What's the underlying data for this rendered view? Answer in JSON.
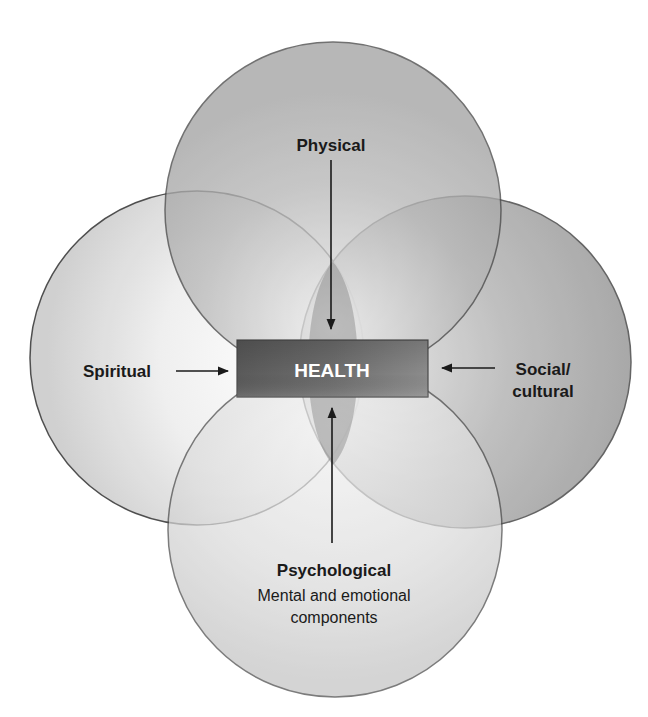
{
  "diagram": {
    "center": {
      "label": "HEALTH"
    },
    "dimensions": [
      {
        "id": "physical",
        "label": "Physical",
        "sublabel": ""
      },
      {
        "id": "spiritual",
        "label": "Spiritual",
        "sublabel": ""
      },
      {
        "id": "social",
        "label_line1": "Social/",
        "label_line2": "cultural"
      },
      {
        "id": "psychological",
        "label": "Psychological",
        "sublabel_line1": "Mental and emotional",
        "sublabel_line2": "components"
      }
    ]
  },
  "colors": {
    "circle_stroke": "#4a4a4a",
    "center_box_dark": "#5c5c5c",
    "center_box_light": "#8a8a8a",
    "center_text": "#ffffff",
    "arrow": "#1a1a1a",
    "background": "#ffffff"
  }
}
